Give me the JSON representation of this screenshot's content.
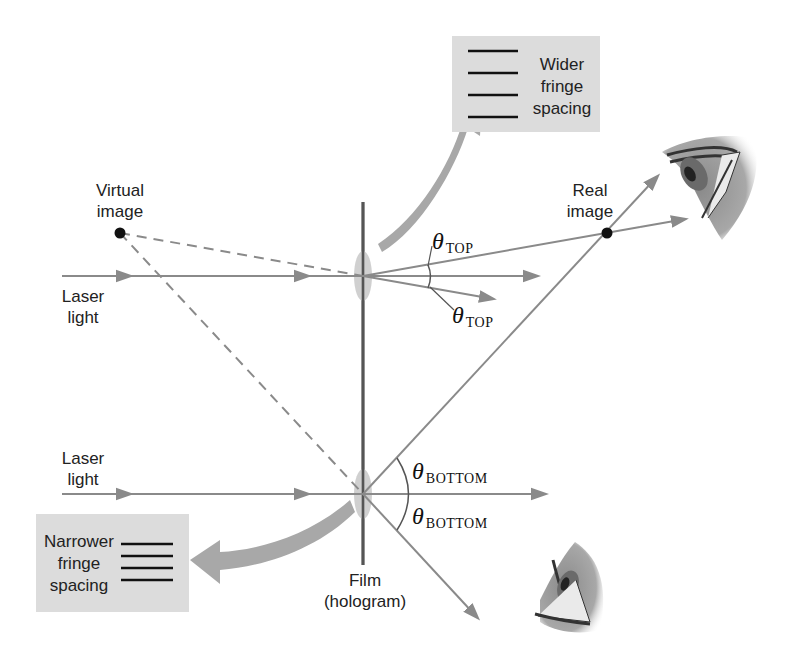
{
  "diagram": {
    "colors": {
      "ray": "#8a8a8a",
      "film": "#555555",
      "box_fill": "#dcdcdc",
      "big_arrow": "#a8a8a8",
      "point": "#111111"
    },
    "labels": {
      "virtual_image": [
        "Virtual",
        "image"
      ],
      "real_image": [
        "Real",
        "image"
      ],
      "laser_top": [
        "Laser",
        "light"
      ],
      "laser_bottom": [
        "Laser",
        "light"
      ],
      "film": [
        "Film",
        "(hologram)"
      ]
    },
    "angles": {
      "top_upper": {
        "symbol": "θ",
        "subscript": "TOP"
      },
      "top_lower": {
        "symbol": "θ",
        "subscript": "TOP"
      },
      "bottom_upper": {
        "symbol": "θ",
        "subscript": "BOTTOM"
      },
      "bottom_lower": {
        "symbol": "θ",
        "subscript": "BOTTOM"
      }
    },
    "callouts": {
      "wider": {
        "lines": [
          "Wider",
          "fringe",
          "spacing"
        ],
        "fringe_count": 4
      },
      "narrower": {
        "lines": [
          "Narrower",
          "fringe",
          "spacing"
        ],
        "fringe_count": 4
      }
    },
    "icons": [
      "eye-icon-top-right",
      "eye-icon-bottom-right"
    ]
  }
}
